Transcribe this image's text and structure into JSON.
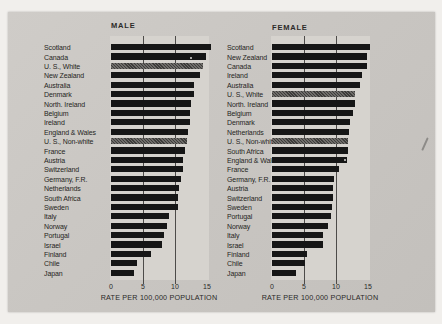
{
  "palette": {
    "photo_bg": "#c9c6c2",
    "band_bg": "#d6d3ce",
    "bar": "#161616",
    "screened_bar": "#55534f",
    "gridline": "#4d4b49",
    "text": "#262522"
  },
  "chart_data": [
    {
      "type": "bar",
      "orientation": "horizontal",
      "title": "MALE",
      "xlabel": "RATE PER 100,000 POPULATION",
      "xlim": [
        0,
        15
      ],
      "xticks": [
        "0",
        "5",
        "10",
        "15"
      ],
      "gridlines": [
        5,
        10
      ],
      "legend": "none",
      "categories": [
        "Scotland",
        "Canada",
        "U. S., White",
        "New Zealand",
        "Australia",
        "Denmark",
        "North. Ireland",
        "Belgium",
        "Ireland",
        "England & Wales",
        "U. S., Non-white",
        "France",
        "Austria",
        "Switzerland",
        "Germany, F.R.",
        "Netherlands",
        "South Africa",
        "Sweden",
        "Italy",
        "Norway",
        "Portugal",
        "Israel",
        "Finland",
        "Chile",
        "Japan"
      ],
      "values": [
        15.6,
        14.8,
        14.3,
        13.9,
        12.9,
        12.9,
        12.5,
        12.3,
        12.3,
        12.0,
        11.8,
        11.5,
        11.2,
        11.2,
        10.9,
        10.7,
        10.5,
        10.4,
        9.0,
        8.7,
        8.3,
        8.0,
        6.2,
        4.0,
        3.6
      ],
      "screened_categories": [
        "U. S., White",
        "U. S., Non-white"
      ]
    },
    {
      "type": "bar",
      "orientation": "horizontal",
      "title": "FEMALE",
      "xlabel": "RATE PER 100,000 POPULATION",
      "xlim": [
        0,
        15
      ],
      "xticks": [
        "0",
        "5",
        "10",
        "15"
      ],
      "gridlines": [
        5,
        10
      ],
      "legend": "none",
      "categories": [
        "Scotland",
        "New Zealand",
        "Canada",
        "Ireland",
        "Australia",
        "U. S., White",
        "North. Ireland",
        "Belgium",
        "Denmark",
        "Netherlands",
        "U. S., Non-white",
        "South Africa",
        "England & Wales",
        "France",
        "Germany, F.R.",
        "Austria",
        "Switzerland",
        "Sweden",
        "Portugal",
        "Norway",
        "Italy",
        "Israel",
        "Finland",
        "Chile",
        "Japan"
      ],
      "values": [
        15.3,
        14.9,
        14.8,
        14.0,
        13.7,
        13.0,
        12.9,
        12.6,
        12.2,
        12.1,
        11.9,
        11.8,
        11.7,
        10.4,
        9.7,
        9.6,
        9.6,
        9.4,
        9.2,
        8.8,
        8.0,
        8.0,
        5.4,
        5.1,
        3.7
      ],
      "screened_categories": [
        "U. S., White",
        "U. S., Non-white"
      ]
    }
  ]
}
